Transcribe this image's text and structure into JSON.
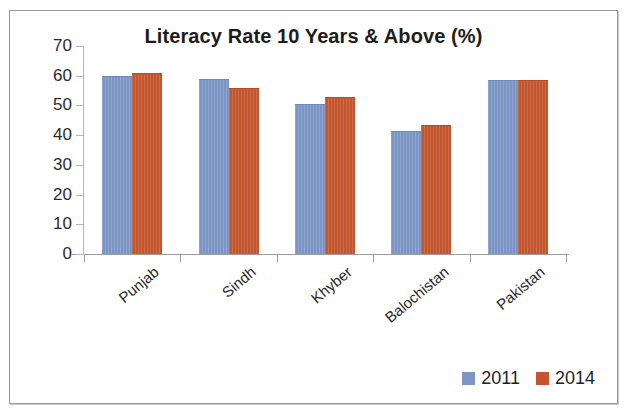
{
  "chart_data": {
    "type": "bar",
    "title": "Literacy Rate 10 Years & Above (%)",
    "xlabel": "",
    "ylabel": "",
    "ylim": [
      0,
      70
    ],
    "yticks": [
      0,
      10,
      20,
      30,
      40,
      50,
      60,
      70
    ],
    "grid": false,
    "legend_position": "bottom-right",
    "categories": [
      "Punjab",
      "Sindh",
      "Khyber",
      "Balochistan",
      "Pakistan"
    ],
    "series": [
      {
        "name": "2011",
        "color": "#7b95c5",
        "values": [
          60,
          59,
          50.5,
          41.5,
          58.5
        ]
      },
      {
        "name": "2014",
        "color": "#c4562f",
        "values": [
          61,
          56,
          53,
          43.5,
          58.5
        ]
      }
    ]
  },
  "legend": {
    "entries": [
      {
        "label": "2011",
        "color": "#7b95c5"
      },
      {
        "label": "2014",
        "color": "#c4562f"
      }
    ]
  },
  "axis": {
    "y_tick_labels": [
      "70",
      "60",
      "50",
      "40",
      "30",
      "20",
      "10",
      "0"
    ]
  }
}
